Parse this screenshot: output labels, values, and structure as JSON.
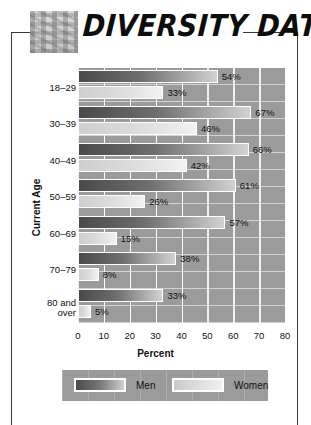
{
  "header": {
    "title": "DIVERSITY DATA",
    "icon": "mosaic-tiles-icon"
  },
  "chart_data": {
    "type": "bar",
    "orientation": "horizontal",
    "title": "DIVERSITY DATA",
    "xlabel": "Percent",
    "ylabel": "Current Age",
    "xlim": [
      0,
      80
    ],
    "xticks": [
      0,
      10,
      20,
      30,
      40,
      50,
      60,
      70,
      80
    ],
    "grid": true,
    "legend_position": "bottom",
    "categories": [
      "18–29",
      "30–39",
      "40–49",
      "50–59",
      "60–69",
      "70–79",
      "80 and over"
    ],
    "series": [
      {
        "name": "Men",
        "color": "#5a5a5a",
        "values": [
          54,
          67,
          66,
          61,
          57,
          38,
          33
        ],
        "labels": [
          "54%",
          "67%",
          "66%",
          "61%",
          "57%",
          "38%",
          "33%"
        ]
      },
      {
        "name": "Women",
        "color": "#dcdcdc",
        "values": [
          33,
          46,
          42,
          26,
          15,
          8,
          5
        ],
        "labels": [
          "33%",
          "46%",
          "42%",
          "26%",
          "15%",
          "8%",
          "5%"
        ]
      }
    ]
  },
  "legend": {
    "men_label": "Men",
    "women_label": "Women"
  },
  "axis": {
    "xlabel": "Percent",
    "ylabel": "Current Age",
    "ticks": [
      "0",
      "10",
      "20",
      "30",
      "40",
      "50",
      "60",
      "70",
      "80"
    ],
    "categories": [
      "18–29",
      "30–39",
      "40–49",
      "50–59",
      "60–69",
      "70–79",
      "80 and over"
    ]
  }
}
